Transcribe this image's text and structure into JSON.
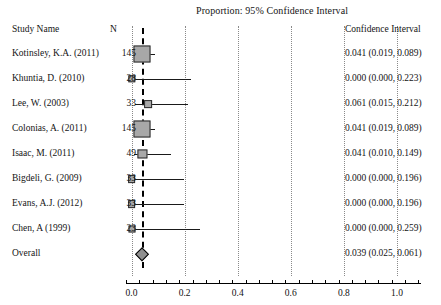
{
  "chart_data": {
    "type": "forest",
    "title": "Proportion: 95% Confidence Interval",
    "xlabel": "",
    "ylabel": "",
    "xlim": [
      -0.05,
      1.12
    ],
    "grid": true,
    "null_value": 0.039,
    "xticks": [
      0.0,
      0.2,
      0.4,
      0.6,
      0.8,
      1.0
    ],
    "xticklabels": [
      "0.0",
      "0.2",
      "0.4",
      "0.6",
      "0.8",
      "1.0"
    ],
    "columns": [
      "Study Name",
      "N",
      "Confidence Interval"
    ],
    "rows": [
      {
        "study": "Kotinsley, K.A. (2011)",
        "n": "145",
        "ci_text": "0.041 (0.019, 0.089)",
        "point": 0.041,
        "lower": 0.019,
        "upper": 0.089,
        "weight": 145
      },
      {
        "study": "Khuntia, D. (2010)",
        "n": "28",
        "ci_text": "0.000 (0.000, 0.223)",
        "point": 0.0,
        "lower": 0.0,
        "upper": 0.223,
        "weight": 28
      },
      {
        "study": "Lee, W. (2003)",
        "n": "33",
        "ci_text": "0.061 (0.015, 0.212)",
        "point": 0.061,
        "lower": 0.015,
        "upper": 0.212,
        "weight": 33
      },
      {
        "study": "Colonias, A. (2011)",
        "n": "145",
        "ci_text": "0.041 (0.019, 0.089)",
        "point": 0.041,
        "lower": 0.019,
        "upper": 0.089,
        "weight": 145
      },
      {
        "study": "Isaac, M. (2011)",
        "n": "49",
        "ci_text": "0.041 (0.010, 0.149)",
        "point": 0.041,
        "lower": 0.01,
        "upper": 0.149,
        "weight": 49
      },
      {
        "study": "Bigdeli, G. (2009)",
        "n": "33",
        "ci_text": "0.000 (0.000, 0.196)",
        "point": 0.0,
        "lower": 0.0,
        "upper": 0.196,
        "weight": 33
      },
      {
        "study": "Evans, A.J. (2012)",
        "n": "33",
        "ci_text": "0.000 (0.000, 0.196)",
        "point": 0.0,
        "lower": 0.0,
        "upper": 0.196,
        "weight": 33
      },
      {
        "study": "Chen, A (1999)",
        "n": "23",
        "ci_text": "0.000 (0.000, 0.259)",
        "point": 0.0,
        "lower": 0.0,
        "upper": 0.259,
        "weight": 23
      }
    ],
    "overall": {
      "study": "Overall",
      "n": "",
      "ci_text": "0.039 (0.025, 0.061)",
      "point": 0.039,
      "lower": 0.025,
      "upper": 0.061
    }
  }
}
